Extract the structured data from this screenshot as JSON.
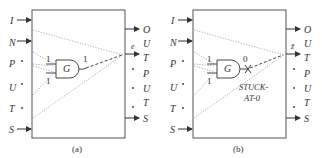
{
  "panels": [
    {
      "caption": "(a)",
      "inputs": [
        "I",
        "N",
        "P",
        "U",
        "T",
        "S"
      ],
      "outputs": [
        "O",
        "U",
        "T",
        "P",
        "U",
        "T",
        "S"
      ],
      "gate": {
        "label": "G",
        "input_values": [
          "1",
          "1"
        ],
        "output_value": "1"
      },
      "output_signal": "e",
      "fault_label": ""
    },
    {
      "caption": "(b)",
      "inputs": [
        "I",
        "N",
        "P",
        "U",
        "T",
        "S"
      ],
      "outputs": [
        "O",
        "U",
        "T",
        "P",
        "U",
        "T",
        "S"
      ],
      "gate": {
        "label": "G",
        "input_values": [
          "1",
          "1"
        ],
        "output_value": "0"
      },
      "output_signal": "z̄",
      "fault_label": [
        "STUCK-",
        "AT-0"
      ]
    }
  ]
}
